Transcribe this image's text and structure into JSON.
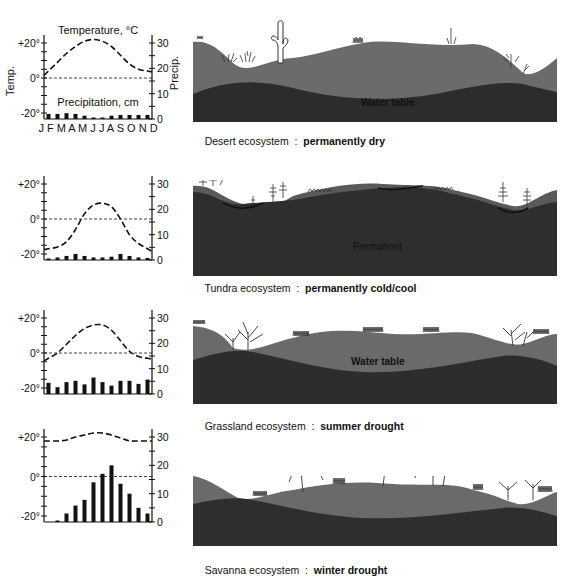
{
  "rows": [
    {
      "id": "desert",
      "caption_name": "Desert ecosystem",
      "caption_sep": "  :  ",
      "caption_desc": "permanently dry",
      "panel_label": "Water table",
      "show_legend_labels": true
    },
    {
      "id": "tundra",
      "caption_name": "Tundra ecosystem",
      "caption_sep": "  :  ",
      "caption_desc": "permanently cold/cool",
      "panel_label": "Permafrost",
      "show_legend_labels": false
    },
    {
      "id": "grassland",
      "caption_name": "Grassland ecosystem",
      "caption_sep": "  :  ",
      "caption_desc": "summer drought",
      "panel_label": "Water table",
      "show_legend_labels": false
    },
    {
      "id": "savanna",
      "caption_name": "Savanna ecosystem",
      "caption_sep": "  :  ",
      "caption_desc": "winter drought",
      "panel_label": "",
      "show_legend_labels": false
    }
  ],
  "axes": {
    "left_label": "Temp.",
    "right_label": "Precip.",
    "left_ticks": [
      "+20°",
      "0°",
      "-20°"
    ],
    "right_ticks": [
      "30",
      "20",
      "10",
      "0"
    ],
    "temp_title": "Temperature, °C",
    "precip_title": "Precipitation, cm",
    "months": "J F M A M J  J A S O N D"
  },
  "chart_data": [
    {
      "type": "bar+line",
      "title": "Desert ecosystem : permanently dry",
      "categories": [
        "J",
        "F",
        "M",
        "A",
        "M",
        "J",
        "J",
        "A",
        "S",
        "O",
        "N",
        "D"
      ],
      "series": [
        {
          "name": "Temperature, °C",
          "type": "line",
          "axis": "left",
          "values": [
            4,
            9,
            14,
            18,
            21,
            22,
            21,
            18,
            13,
            8,
            5,
            4
          ]
        },
        {
          "name": "Precipitation, cm",
          "type": "bar",
          "axis": "right",
          "values": [
            2,
            2,
            2.3,
            2,
            1.3,
            0.3,
            0.3,
            1.3,
            1.6,
            1.6,
            1.6,
            1.6
          ]
        }
      ],
      "ylim_left": [
        -22,
        24
      ],
      "ylim_right": [
        0,
        31
      ],
      "xlabel": "",
      "ylabel_left": "Temp.",
      "ylabel_right": "Precip.",
      "reference_line": 0
    },
    {
      "type": "bar+line",
      "title": "Tundra ecosystem : permanently cold/cool",
      "categories": [
        "J",
        "F",
        "M",
        "A",
        "M",
        "J",
        "J",
        "A",
        "S",
        "O",
        "N",
        "D"
      ],
      "series": [
        {
          "name": "Temperature, °C",
          "type": "line",
          "axis": "left",
          "values": [
            -17,
            -16,
            -13,
            -6,
            3,
            8,
            9,
            7,
            0,
            -9,
            -14,
            -17
          ]
        },
        {
          "name": "Precipitation, cm",
          "type": "bar",
          "axis": "right",
          "values": [
            0.6,
            1,
            1.6,
            2.4,
            1.6,
            1,
            1,
            1.3,
            2.4,
            1.6,
            1,
            0.8
          ]
        }
      ],
      "ylim_left": [
        -22,
        24
      ],
      "ylim_right": [
        0,
        31
      ],
      "reference_line": 0
    },
    {
      "type": "bar+line",
      "title": "Grassland ecosystem : summer drought",
      "categories": [
        "J",
        "F",
        "M",
        "A",
        "M",
        "J",
        "J",
        "A",
        "S",
        "O",
        "N",
        "D"
      ],
      "series": [
        {
          "name": "Temperature, °C",
          "type": "line",
          "axis": "left",
          "values": [
            -3,
            0,
            5,
            10,
            14,
            16,
            16,
            13,
            7,
            1,
            -2,
            -3
          ]
        },
        {
          "name": "Precipitation, cm",
          "type": "bar",
          "axis": "right",
          "values": [
            4.4,
            2.7,
            4.7,
            5.2,
            3.8,
            6.5,
            4.7,
            3.3,
            5.2,
            5.2,
            4.0,
            5.7
          ]
        }
      ],
      "ylim_left": [
        -22,
        24
      ],
      "ylim_right": [
        0,
        31
      ],
      "reference_line": 0
    },
    {
      "type": "bar+line",
      "title": "Savanna ecosystem : winter drought",
      "categories": [
        "J",
        "F",
        "M",
        "A",
        "M",
        "J",
        "J",
        "A",
        "S",
        "O",
        "N",
        "D"
      ],
      "series": [
        {
          "name": "Temperature, °C",
          "type": "line",
          "axis": "left",
          "values": [
            18,
            18,
            18.5,
            20,
            21,
            22,
            22,
            21,
            19.5,
            18,
            18,
            18
          ]
        },
        {
          "name": "Precipitation, cm",
          "type": "bar",
          "axis": "right",
          "values": [
            0,
            0.5,
            3,
            5.8,
            7.8,
            14,
            17,
            20,
            13.5,
            10,
            5,
            3
          ]
        }
      ],
      "ylim_left": [
        -22,
        24
      ],
      "ylim_right": [
        0,
        31
      ],
      "reference_line": 0
    }
  ]
}
